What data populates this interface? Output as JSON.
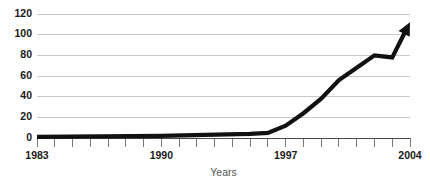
{
  "chart_data": {
    "type": "line",
    "title": "",
    "xlabel": "Years",
    "ylabel": "",
    "xlim": [
      1983,
      2004
    ],
    "ylim": [
      0,
      120
    ],
    "grid": true,
    "legend": "none",
    "line_color": "#111111",
    "grid_color": "#c9c9c9",
    "axis_color": "#4a4a4a",
    "arrow_end": true,
    "y_ticks": [
      0,
      20,
      40,
      60,
      80,
      100,
      120
    ],
    "y_tick_labels": [
      "0",
      "20",
      "40",
      "60",
      "80",
      "100",
      "120"
    ],
    "x_ticks": [
      1983,
      1984,
      1985,
      1986,
      1987,
      1988,
      1989,
      1990,
      1991,
      1992,
      1993,
      1994,
      1995,
      1996,
      1997,
      1998,
      1999,
      2000,
      2001,
      2002,
      2003,
      2004
    ],
    "x_tick_labels": [
      "1983",
      "",
      "",
      "",
      "",
      "",
      "",
      "1990",
      "",
      "",
      "",
      "",
      "",
      "",
      "1997",
      "",
      "",
      "",
      "",
      "",
      "",
      "2004"
    ],
    "x_labeled_ticks": [
      {
        "value": 1983,
        "label": "1983"
      },
      {
        "value": 1990,
        "label": "1990"
      },
      {
        "value": 1997,
        "label": "1997"
      },
      {
        "value": 2004,
        "label": "2004"
      }
    ],
    "x": [
      1983,
      1990,
      1995,
      1996,
      1997,
      1998,
      1999,
      2000,
      2001,
      2002,
      2003,
      2004
    ],
    "values": [
      1,
      2,
      4,
      5,
      12,
      24,
      38,
      56,
      68,
      80,
      78,
      112
    ],
    "series": [
      {
        "name": "series-1",
        "x": [
          1983,
          1990,
          1995,
          1996,
          1997,
          1998,
          1999,
          2000,
          2001,
          2002,
          2003,
          2004
        ],
        "values": [
          1,
          2,
          4,
          5,
          12,
          24,
          38,
          56,
          68,
          80,
          78,
          112
        ]
      }
    ]
  },
  "axis": {
    "x_title": "Years"
  }
}
